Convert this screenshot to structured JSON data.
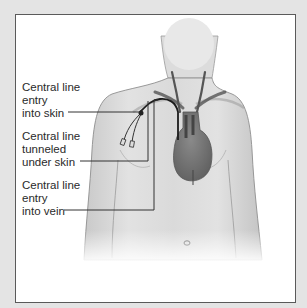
{
  "diagram": {
    "colors": {
      "background": "#e4e4e4",
      "panel": "#ffffff",
      "frame": "#5a5a5a",
      "skin": "#d9d9d9",
      "heart": "#7a7a7a",
      "vessels": "#555555",
      "leader_lines": "#333333"
    },
    "labels": [
      {
        "id": "entry-skin",
        "lines": [
          "Central line",
          "entry",
          "into skin"
        ]
      },
      {
        "id": "tunneled",
        "lines": [
          "Central line",
          "tunneled",
          "under skin"
        ]
      },
      {
        "id": "entry-vein",
        "lines": [
          "Central line",
          "entry",
          "into vein"
        ]
      }
    ]
  }
}
